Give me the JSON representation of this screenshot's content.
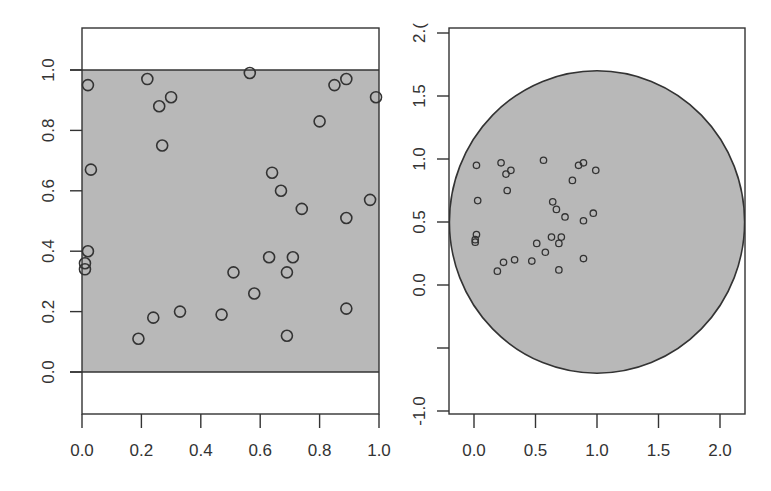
{
  "chart_data": [
    {
      "type": "scatter",
      "title": "",
      "xlabel": "",
      "ylabel": "",
      "xlim": [
        0.0,
        1.0
      ],
      "ylim": [
        -0.13,
        1.13
      ],
      "grid": false,
      "legend": null,
      "xticks": [
        "0.0",
        "0.2",
        "0.4",
        "0.6",
        "0.8",
        "1.0"
      ],
      "xtick_values": [
        0.0,
        0.2,
        0.4,
        0.6,
        0.8,
        1.0
      ],
      "yticks": [
        "0.0",
        "0.2",
        "0.4",
        "0.6",
        "0.8",
        "1.0"
      ],
      "ytick_values": [
        0.0,
        0.2,
        0.4,
        0.6,
        0.8,
        1.0
      ],
      "region": {
        "shape": "rect",
        "x0": 0.0,
        "x1": 1.0,
        "y0": 0.0,
        "y1": 1.0,
        "fill": "#b8b8b8"
      },
      "marker": {
        "shape": "open-circle",
        "size": 5.5
      },
      "points": [
        [
          0.02,
          0.95
        ],
        [
          0.22,
          0.97
        ],
        [
          0.26,
          0.88
        ],
        [
          0.3,
          0.91
        ],
        [
          0.27,
          0.75
        ],
        [
          0.03,
          0.67
        ],
        [
          0.565,
          0.99
        ],
        [
          0.85,
          0.95
        ],
        [
          0.89,
          0.97
        ],
        [
          0.99,
          0.91
        ],
        [
          0.8,
          0.83
        ],
        [
          0.64,
          0.66
        ],
        [
          0.67,
          0.6
        ],
        [
          0.74,
          0.54
        ],
        [
          0.97,
          0.57
        ],
        [
          0.89,
          0.51
        ],
        [
          0.02,
          0.4
        ],
        [
          0.01,
          0.36
        ],
        [
          0.01,
          0.34
        ],
        [
          0.19,
          0.11
        ],
        [
          0.24,
          0.18
        ],
        [
          0.33,
          0.2
        ],
        [
          0.47,
          0.19
        ],
        [
          0.51,
          0.33
        ],
        [
          0.63,
          0.38
        ],
        [
          0.71,
          0.38
        ],
        [
          0.69,
          0.33
        ],
        [
          0.58,
          0.26
        ],
        [
          0.89,
          0.21
        ],
        [
          0.69,
          0.12
        ]
      ]
    },
    {
      "type": "scatter",
      "title": "",
      "xlabel": "",
      "ylabel": "",
      "xlim": [
        -0.2,
        2.2
      ],
      "ylim": [
        -1.02,
        2.02
      ],
      "grid": false,
      "legend": null,
      "xticks": [
        "0.0",
        "0.5",
        "1.0",
        "1.5",
        "2.0"
      ],
      "xtick_values": [
        0.0,
        0.5,
        1.0,
        1.5,
        2.0
      ],
      "yticks": [
        "-1.0",
        "",
        "0.0",
        "0.5",
        "1.0",
        "1.5",
        "2.("
      ],
      "ytick_values": [
        -1.0,
        -0.5,
        0.0,
        0.5,
        1.0,
        1.5,
        2.0
      ],
      "region": {
        "shape": "circle",
        "cx": 1.0,
        "cy": 0.5,
        "r": 1.2,
        "fill": "#b8b8b8"
      },
      "marker": {
        "shape": "open-circle",
        "size": 3.2
      },
      "points": [
        [
          0.02,
          0.95
        ],
        [
          0.22,
          0.97
        ],
        [
          0.26,
          0.88
        ],
        [
          0.3,
          0.91
        ],
        [
          0.27,
          0.75
        ],
        [
          0.03,
          0.67
        ],
        [
          0.565,
          0.99
        ],
        [
          0.85,
          0.95
        ],
        [
          0.89,
          0.97
        ],
        [
          0.99,
          0.91
        ],
        [
          0.8,
          0.83
        ],
        [
          0.64,
          0.66
        ],
        [
          0.67,
          0.6
        ],
        [
          0.74,
          0.54
        ],
        [
          0.97,
          0.57
        ],
        [
          0.89,
          0.51
        ],
        [
          0.02,
          0.4
        ],
        [
          0.01,
          0.36
        ],
        [
          0.01,
          0.34
        ],
        [
          0.19,
          0.11
        ],
        [
          0.24,
          0.18
        ],
        [
          0.33,
          0.2
        ],
        [
          0.47,
          0.19
        ],
        [
          0.51,
          0.33
        ],
        [
          0.63,
          0.38
        ],
        [
          0.71,
          0.38
        ],
        [
          0.69,
          0.33
        ],
        [
          0.58,
          0.26
        ],
        [
          0.89,
          0.21
        ],
        [
          0.69,
          0.12
        ]
      ]
    }
  ],
  "layout": {
    "panels": [
      {
        "frame": {
          "left": 82,
          "top": 28,
          "right": 379,
          "bottom": 414
        },
        "x_px": [
          82,
          379
        ],
        "y_px": [
          372,
          70
        ],
        "y_ref": [
          0.0,
          1.0
        ]
      },
      {
        "frame": {
          "left": 449,
          "top": 28,
          "right": 745,
          "bottom": 414
        },
        "x_px": [
          474,
          720
        ],
        "x_ref": [
          0.0,
          2.0
        ],
        "y_px": [
          285,
          159
        ],
        "y_ref": [
          0.0,
          1.0
        ]
      }
    ],
    "colors": {
      "axis": "#333333",
      "fill": "#b8b8b8",
      "marker": "#333333"
    }
  }
}
